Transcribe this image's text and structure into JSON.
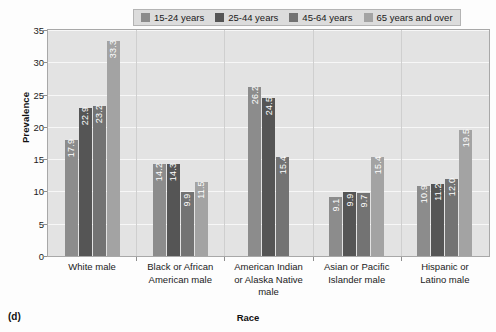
{
  "figure": {
    "panel_letter": "(d)",
    "ylabel": "Prevalence",
    "xlabel": "Race"
  },
  "legend": {
    "items": [
      {
        "label": "15-24 years",
        "color": "#8c8c8c"
      },
      {
        "label": "25-44 years",
        "color": "#555555"
      },
      {
        "label": "45-64 years",
        "color": "#737373"
      },
      {
        "label": "65 years and over",
        "color": "#a3a3a3"
      }
    ]
  },
  "chart_data": {
    "type": "bar",
    "title": "",
    "xlabel": "Race",
    "ylabel": "Prevalence",
    "ylim": [
      0,
      35
    ],
    "yticks": [
      0,
      5,
      10,
      15,
      20,
      25,
      30,
      35
    ],
    "grid": true,
    "legend_position": "top",
    "categories": [
      "White male",
      "Black or African American male",
      "American Indian or Alaska Native male",
      "Asian or Pacific Islander male",
      "Hispanic or Latino male"
    ],
    "category_lines": [
      [
        "White male"
      ],
      [
        "Black or African",
        "American male"
      ],
      [
        "American Indian",
        "or Alaska Native",
        "male"
      ],
      [
        "Asian or Pacific",
        "Islander male"
      ],
      [
        "Hispanic or",
        "Latino male"
      ]
    ],
    "series": [
      {
        "name": "15-24 years",
        "color": "#8c8c8c",
        "values": [
          17.9,
          14.2,
          26.2,
          9.1,
          10.9
        ]
      },
      {
        "name": "25-44 years",
        "color": "#555555",
        "values": [
          22.9,
          14.3,
          24.5,
          9.9,
          11.2
        ]
      },
      {
        "name": "45-64 years",
        "color": "#737373",
        "values": [
          23.2,
          9.9,
          15.4,
          9.7,
          12.0
        ]
      },
      {
        "name": "65 years and over",
        "color": "#a3a3a3",
        "values": [
          33.3,
          11.5,
          null,
          15.4,
          19.5
        ]
      }
    ],
    "value_labels": [
      [
        "17.9",
        "22.9",
        "23.2",
        "33.3"
      ],
      [
        "14.2",
        "14.3",
        "9.9",
        "11.5"
      ],
      [
        "26.2",
        "24.5",
        "15.4",
        null
      ],
      [
        "9.1",
        "9.9",
        "9.7",
        "15.4"
      ],
      [
        "10.9",
        "11.2",
        "12.0",
        "19.5"
      ]
    ]
  },
  "colors": {
    "plot_background": "#e3e3e3",
    "gridline": "#f7f7f7",
    "frame_border": "#a8a8a8",
    "legend_background": "#dcdcdc"
  }
}
